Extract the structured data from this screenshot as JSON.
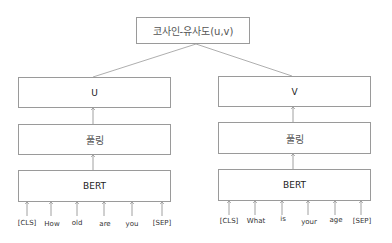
{
  "top": {
    "label": "코사인-유사도(u,v)"
  },
  "left": {
    "output_label": "U",
    "pooling_label": "풀링",
    "encoder_label": "BERT",
    "tokens": [
      "[CLS]",
      "How",
      "old",
      "are",
      "you",
      "[SEP]"
    ]
  },
  "right": {
    "output_label": "V",
    "pooling_label": "풀링",
    "encoder_label": "BERT",
    "tokens": [
      "[CLS]",
      "What",
      "is",
      "your",
      "age",
      "[SEP]"
    ]
  },
  "colors": {
    "stroke": "#9a9a9a",
    "text": "#222222"
  }
}
